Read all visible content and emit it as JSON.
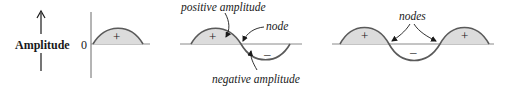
{
  "diagram": {
    "panels": [
      {
        "name": "half-wave",
        "axis_label": "Amplitude",
        "zero_label": "0",
        "lobes": [
          "+"
        ]
      },
      {
        "name": "full-wave",
        "lobes": [
          "+",
          "–"
        ],
        "annotations": {
          "positive": "positive amplitude",
          "node": "node",
          "negative": "negative amplitude"
        }
      },
      {
        "name": "three-lobe-wave",
        "lobes": [
          "+",
          "–",
          "+"
        ],
        "annotations": {
          "nodes": "nodes"
        }
      }
    ],
    "colors": {
      "curve": "#5a5a5a",
      "fill": "#dcdcdc",
      "axis": "#8a8a8a",
      "text": "#1a1a1a"
    }
  }
}
